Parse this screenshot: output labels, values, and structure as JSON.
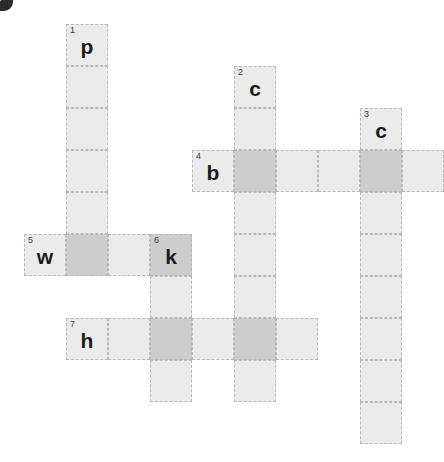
{
  "puzzle": {
    "title": "crossword-grid",
    "cell_size": 42,
    "origin": {
      "x": 24,
      "y": 24
    },
    "colors": {
      "cell_light": "#ebebeb",
      "cell_shaded": "#cdcdcd",
      "cell_border": "#b9b9b9",
      "letter": "#1a1a1a",
      "number": "#3a3a3a",
      "background": "#ffffff"
    },
    "clue_numbers": [
      "1",
      "2",
      "3",
      "4",
      "5",
      "6",
      "7"
    ],
    "entry_letters": [
      "p",
      "c",
      "c",
      "b",
      "w",
      "k",
      "h"
    ],
    "cells": [
      {
        "col": 1,
        "row": 0,
        "shaded": false,
        "num": "1",
        "letter": "p"
      },
      {
        "col": 1,
        "row": 1,
        "shaded": false,
        "num": "",
        "letter": ""
      },
      {
        "col": 1,
        "row": 2,
        "shaded": false,
        "num": "",
        "letter": ""
      },
      {
        "col": 1,
        "row": 3,
        "shaded": false,
        "num": "",
        "letter": ""
      },
      {
        "col": 1,
        "row": 4,
        "shaded": false,
        "num": "",
        "letter": ""
      },
      {
        "col": 1,
        "row": 5,
        "shaded": true,
        "num": "",
        "letter": ""
      },
      {
        "col": 5,
        "row": 1,
        "shaded": false,
        "num": "2",
        "letter": "c"
      },
      {
        "col": 5,
        "row": 2,
        "shaded": false,
        "num": "",
        "letter": ""
      },
      {
        "col": 5,
        "row": 3,
        "shaded": true,
        "num": "",
        "letter": ""
      },
      {
        "col": 5,
        "row": 4,
        "shaded": false,
        "num": "",
        "letter": ""
      },
      {
        "col": 5,
        "row": 5,
        "shaded": false,
        "num": "",
        "letter": ""
      },
      {
        "col": 5,
        "row": 6,
        "shaded": false,
        "num": "",
        "letter": ""
      },
      {
        "col": 5,
        "row": 7,
        "shaded": true,
        "num": "",
        "letter": ""
      },
      {
        "col": 5,
        "row": 8,
        "shaded": false,
        "num": "",
        "letter": ""
      },
      {
        "col": 8,
        "row": 2,
        "shaded": false,
        "num": "3",
        "letter": "c"
      },
      {
        "col": 8,
        "row": 3,
        "shaded": true,
        "num": "",
        "letter": ""
      },
      {
        "col": 8,
        "row": 4,
        "shaded": false,
        "num": "",
        "letter": ""
      },
      {
        "col": 8,
        "row": 5,
        "shaded": false,
        "num": "",
        "letter": ""
      },
      {
        "col": 8,
        "row": 6,
        "shaded": false,
        "num": "",
        "letter": ""
      },
      {
        "col": 8,
        "row": 7,
        "shaded": false,
        "num": "",
        "letter": ""
      },
      {
        "col": 8,
        "row": 8,
        "shaded": false,
        "num": "",
        "letter": ""
      },
      {
        "col": 8,
        "row": 9,
        "shaded": false,
        "num": "",
        "letter": ""
      },
      {
        "col": 4,
        "row": 3,
        "shaded": false,
        "num": "4",
        "letter": "b"
      },
      {
        "col": 6,
        "row": 3,
        "shaded": false,
        "num": "",
        "letter": ""
      },
      {
        "col": 7,
        "row": 3,
        "shaded": false,
        "num": "",
        "letter": ""
      },
      {
        "col": 9,
        "row": 3,
        "shaded": false,
        "num": "",
        "letter": ""
      },
      {
        "col": 0,
        "row": 5,
        "shaded": false,
        "num": "5",
        "letter": "w"
      },
      {
        "col": 2,
        "row": 5,
        "shaded": false,
        "num": "",
        "letter": ""
      },
      {
        "col": 3,
        "row": 5,
        "shaded": true,
        "num": "6",
        "letter": "k"
      },
      {
        "col": 3,
        "row": 6,
        "shaded": false,
        "num": "",
        "letter": ""
      },
      {
        "col": 3,
        "row": 8,
        "shaded": false,
        "num": "",
        "letter": ""
      },
      {
        "col": 1,
        "row": 7,
        "shaded": false,
        "num": "7",
        "letter": "h"
      },
      {
        "col": 2,
        "row": 7,
        "shaded": false,
        "num": "",
        "letter": ""
      },
      {
        "col": 3,
        "row": 7,
        "shaded": true,
        "num": "",
        "letter": ""
      },
      {
        "col": 4,
        "row": 7,
        "shaded": false,
        "num": "",
        "letter": ""
      },
      {
        "col": 6,
        "row": 7,
        "shaded": false,
        "num": "",
        "letter": ""
      }
    ]
  }
}
